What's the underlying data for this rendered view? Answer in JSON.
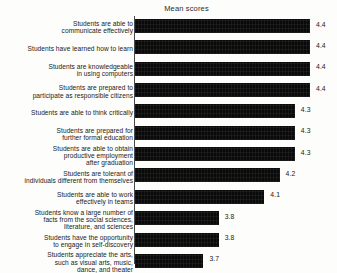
{
  "chart_data": {
    "type": "bar",
    "orientation": "horizontal",
    "title": "Mean scores",
    "xlabel": "",
    "ylabel": "",
    "grid": false,
    "legend": false,
    "value_labels": true,
    "axis_note": "truncated value axis; bars do not start at zero",
    "categories": [
      "Students are able to communicate effectively",
      "Students have learned how to learn",
      "Students are knowledgeable in using computers",
      "Students are prepared to participate as responsible citizens",
      "Students are able to think critically",
      "Students are prepared for further formal education",
      "Students are able to obtain productive employment after graduation",
      "Students are tolerant of individuals different from themselves",
      "Students are able to work effectively in teams",
      "Students know a large number of facts from the social sciences, literature, and sciences",
      "Students have the opportunity to engage in self-discovery",
      "Students appreciate the arts, such as visual arts, music, dance, and theater"
    ],
    "category_lines": [
      [
        "Students are able to",
        "communicate effectively"
      ],
      [
        "Students have learned how to learn"
      ],
      [
        "Students are knowledgeable",
        "in using computers"
      ],
      [
        "Students are prepared to",
        "participate as responsible citizens"
      ],
      [
        "Students are able to think critically"
      ],
      [
        "Students are prepared for",
        "further formal education"
      ],
      [
        "Students are able to obtain",
        "productive employment",
        "after graduation"
      ],
      [
        "Students are tolerant of",
        "individuals different from themselves"
      ],
      [
        "Students are able to work",
        "effectively in teams"
      ],
      [
        "Students know a large number of",
        "facts from the social sciences,",
        "literature, and sciences"
      ],
      [
        "Students have the opportunity",
        "to engage in self-discovery"
      ],
      [
        "Students appreciate the arts,",
        "such as visual arts, music,",
        "dance, and theater"
      ]
    ],
    "values": [
      4.4,
      4.4,
      4.4,
      4.4,
      4.3,
      4.3,
      4.3,
      4.2,
      4.1,
      3.8,
      3.8,
      3.7
    ],
    "value_label_text": [
      "4.4",
      "4.4",
      "4.4",
      "4.4",
      "4.3",
      "4.3",
      "4.3",
      "4.2",
      "4.1",
      "3.8",
      "3.8",
      "3.7"
    ],
    "bar_color": "#0a0a0a",
    "background_color": "#fdfdfb",
    "xlim": [
      3.25,
      4.5
    ]
  }
}
